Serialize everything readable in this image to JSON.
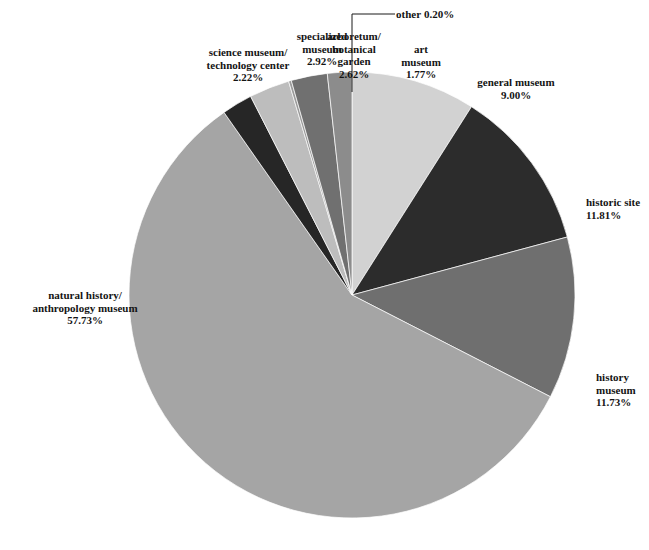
{
  "chart_data": {
    "type": "pie",
    "title": "",
    "xlabel": "",
    "ylabel": "",
    "units": "percent",
    "start_angle_deg": 0,
    "direction": "clockwise",
    "categories": [
      "general museum",
      "historic site",
      "history museum",
      "natural history/anthropology museum",
      "science museum/technology center",
      "specialized museum",
      "other",
      "arboretum/botanical garden",
      "art museum"
    ],
    "values": [
      9.0,
      11.81,
      11.73,
      57.73,
      2.22,
      2.92,
      0.2,
      2.62,
      1.77
    ],
    "colors": [
      "#d2d2d2",
      "#2c2c2c",
      "#6f6f6f",
      "#a5a5a5",
      "#262626",
      "#bdbdbd",
      "#9a9a9a",
      "#707070",
      "#8c8c8c"
    ],
    "legend_position": "callout-labels"
  },
  "slices": [
    {
      "name": "general-museum",
      "line1": "general museum",
      "pct": "9.00%",
      "value": 9.0,
      "color": "#d2d2d2"
    },
    {
      "name": "historic-site",
      "line1": "historic site",
      "pct": "11.81%",
      "value": 11.81,
      "color": "#2c2c2c"
    },
    {
      "name": "history-museum",
      "line1": "history",
      "line2": "museum",
      "pct": "11.73%",
      "value": 11.73,
      "color": "#6f6f6f"
    },
    {
      "name": "natural-history-anthropology-museum",
      "line1": "natural history/",
      "line2": "anthropology museum",
      "pct": "57.73%",
      "value": 57.73,
      "color": "#a5a5a5"
    },
    {
      "name": "science-museum-technology-center",
      "line1": "science museum/",
      "line2": "technology center",
      "pct": "2.22%",
      "value": 2.22,
      "color": "#262626"
    },
    {
      "name": "specialized-museum",
      "line1": "specialized",
      "line2": "museum",
      "pct": "2.92%",
      "value": 2.92,
      "color": "#bdbdbd"
    },
    {
      "name": "other",
      "line1": "other",
      "pct": "0.20%",
      "value": 0.2,
      "color": "#9a9a9a"
    },
    {
      "name": "arboretum-botanical-garden",
      "line1": "arboretum/",
      "line2": "botanical",
      "line3": "garden",
      "pct": "2.62%",
      "value": 2.62,
      "color": "#707070"
    },
    {
      "name": "art-museum",
      "line1": "art",
      "line2": "museum",
      "pct": "1.77%",
      "value": 1.77,
      "color": "#8c8c8c"
    }
  ]
}
